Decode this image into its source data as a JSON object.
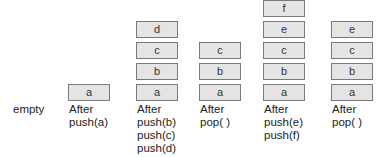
{
  "diagram": {
    "type": "stack-operations",
    "states": [
      {
        "caption": "empty",
        "items": []
      },
      {
        "caption": "After\npush(a)",
        "items": [
          "a"
        ]
      },
      {
        "caption": "After\npush(b)\npush(c)\npush(d)",
        "items": [
          "a",
          "b",
          "c",
          "d"
        ]
      },
      {
        "caption": "After\npop( )",
        "items": [
          "a",
          "b",
          "c"
        ]
      },
      {
        "caption": "After\npush(e)\npush(f)",
        "items": [
          "a",
          "b",
          "c",
          "e",
          "f"
        ]
      },
      {
        "caption": "After\npop( )",
        "items": [
          "a",
          "b",
          "c",
          "e"
        ]
      }
    ],
    "colors": {
      "box_fill": "#e4e4e4",
      "box_border": "#7a7a7a",
      "text": "#222222"
    }
  }
}
